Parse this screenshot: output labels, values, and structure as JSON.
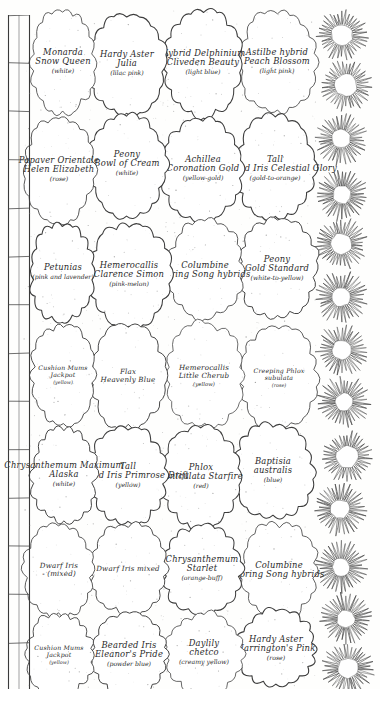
{
  "document": {
    "kind": "hand-drawn garden planting plan",
    "orientation": "labels rotated 90 degrees (sideways)",
    "ink_color": "#2a2a2a",
    "paper_color": "#fefefd"
  },
  "border": {
    "flower_edging": {
      "name": "daisy-flower-edging-row",
      "count": 13
    },
    "wall": {
      "name": "brick-wall-edge",
      "segments": 14
    }
  },
  "beds": [
    {
      "id": "bed-astilbe",
      "name1": "Astilbe hybrid",
      "name2": "Peach Blossom",
      "color": "(light pink)"
    },
    {
      "id": "bed-delphinium",
      "name1": "Hybrid Delphinium",
      "name2": "Cliveden Beauty",
      "color": "(light blue)"
    },
    {
      "id": "bed-hardy-aster-julia",
      "name1": "Hardy Aster",
      "name2": "Julia",
      "color": "(lilac pink)"
    },
    {
      "id": "bed-monarda",
      "name1": "Monarda",
      "name2": "Snow Queen",
      "color": "(white)"
    },
    {
      "id": "bed-baptisia",
      "name1": "Baptisia",
      "name2": "australis",
      "color": "(blue)"
    },
    {
      "id": "bed-phlox-starfire",
      "name1": "Phlox",
      "name2": "paniculata Starfire",
      "color": "(red)"
    },
    {
      "id": "bed-hardy-aster-harr",
      "name1": "Hardy Aster",
      "name2": "Harrington's Pink",
      "color": "(rose)"
    },
    {
      "id": "bed-tall-bearded-iris-cg",
      "name1": "Tall",
      "name2": "Bearded Iris Celestial Glory",
      "color": "(gold-to-orange)"
    },
    {
      "id": "bed-achillea",
      "name1": "Achillea",
      "name2": "Coronation Gold",
      "color": "(yellow-gold)"
    },
    {
      "id": "bed-peony-bowl",
      "name1": "Peony",
      "name2": "Bowl of Cream",
      "color": "(white)"
    },
    {
      "id": "bed-papaver",
      "name1": "Papaver Orientale",
      "name2": "Helen Elizabeth",
      "color": "(rose)"
    },
    {
      "id": "bed-tall-bearded-iris-pd",
      "name1": "Tall",
      "name2": "Bearded Iris Primrose Drift",
      "color": "(yellow)"
    },
    {
      "id": "bed-chrysanthemum-alaska",
      "name1": "Chrysanthemum Maximum",
      "name2": "Alaska",
      "color": "(white)"
    },
    {
      "id": "bed-daylily-chetco",
      "name1": "Daylily",
      "name2": "chetco",
      "color": "(creamy yellow)"
    },
    {
      "id": "bed-peony-gold-standard",
      "name1": "Peony",
      "name2": "Gold Standard",
      "color": "(white-to-yellow)"
    },
    {
      "id": "bed-columbine-ssh",
      "name1": "Columbine",
      "name2": "Spring Song hybrids",
      "color": ""
    },
    {
      "id": "bed-hemerocallis-cs",
      "name1": "Hemerocallis",
      "name2": "Clarence Simon",
      "color": "(pink-melon)"
    },
    {
      "id": "bed-columbine-ssh2",
      "name1": "Columbine",
      "name2": "Spring Song hybrids",
      "color": ""
    },
    {
      "id": "bed-chrysanthemum-starlet",
      "name1": "Chrysanthemum",
      "name2": "Starlet",
      "color": "(orange-buff)"
    },
    {
      "id": "bed-bearded-iris-ep",
      "name1": "Bearded Iris",
      "name2": "Eleanor's Pride",
      "color": "(powder blue)"
    },
    {
      "id": "bed-creeping-phlox-top",
      "name1": "Creeping Phlox",
      "name2": "subulata",
      "color": "(rose)"
    },
    {
      "id": "bed-hemerocallis-lc",
      "name1": "Hemerocallis",
      "name2": "Little Cherub",
      "color": "(yellow)"
    },
    {
      "id": "bed-flax",
      "name1": "Flax",
      "name2": "Heavenly Blue",
      "color": ""
    },
    {
      "id": "bed-cushion-mums-top",
      "name1": "Cushion Mums",
      "name2": "Jackpot",
      "color": "(yellow)"
    },
    {
      "id": "bed-petunias",
      "name1": "Petunias",
      "name2": "",
      "color": "(pink and lavender)"
    },
    {
      "id": "bed-dwarf-iris-mixed",
      "name1": "Dwarf Iris mixed",
      "name2": "",
      "color": ""
    },
    {
      "id": "bed-dwarf-iris-mixed2",
      "name1": "Dwarf Iris",
      "name2": "- (mixed)",
      "color": ""
    },
    {
      "id": "bed-cushion-mums-bot",
      "name1": "Cushion Mums",
      "name2": "Jackpot",
      "color": "(yellow)"
    },
    {
      "id": "bed-creeping-phlox-bot",
      "name1": "Creeping Phlox",
      "name2": "subulata",
      "color": "(rose)"
    }
  ]
}
